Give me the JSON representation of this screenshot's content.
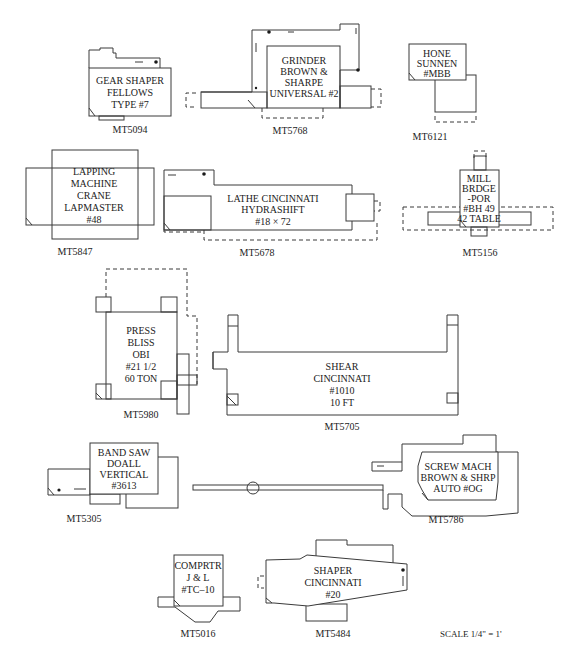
{
  "diagram": {
    "type": "machine-shop-floor-layout",
    "scale_label": "SCALE 1/4\" = 1'",
    "machines": [
      {
        "id": "MT5094",
        "tag": "MT5094",
        "lines": [
          "GEAR SHAPER",
          "FELLOWS",
          "TYPE #7"
        ]
      },
      {
        "id": "MT5768",
        "tag": "MT5768",
        "lines": [
          "GRINDER",
          "BROWN &",
          "SHARPE",
          "UNIVERSAL #2"
        ]
      },
      {
        "id": "MT6121",
        "tag": "MT6121",
        "lines": [
          "HONE",
          "SUNNEN",
          "#MBB"
        ]
      },
      {
        "id": "MT5847",
        "tag": "MT5847",
        "lines": [
          "LAPPING",
          "MACHINE",
          "CRANE",
          "LAPMASTER",
          "#48"
        ]
      },
      {
        "id": "MT5678",
        "tag": "MT5678",
        "lines": [
          "LATHE CINCINNATI",
          "HYDRASHIFT",
          "#18 × 72"
        ]
      },
      {
        "id": "MT5156",
        "tag": "MT5156",
        "lines": [
          "MILL",
          "BRDGE",
          "-POR",
          "#BH 49",
          "42 TABLE"
        ]
      },
      {
        "id": "MT5980",
        "tag": "MT5980",
        "lines": [
          "PRESS",
          "BLISS",
          "OBI",
          "#21 1/2",
          "60 TON"
        ]
      },
      {
        "id": "MT5705",
        "tag": "MT5705",
        "lines": [
          "SHEAR",
          "CINCINNATI",
          "#1010",
          "10 FT"
        ]
      },
      {
        "id": "MT5305",
        "tag": "MT5305",
        "lines": [
          "BAND SAW",
          "DOALL",
          "VERTICAL",
          "#3613"
        ]
      },
      {
        "id": "MT5786",
        "tag": "MT5786",
        "lines": [
          "SCREW MACH",
          "BROWN & SHRP",
          "AUTO #OG"
        ]
      },
      {
        "id": "MT5016",
        "tag": "MT5016",
        "lines": [
          "COMPRTR",
          "J & L",
          "#TC–10"
        ]
      },
      {
        "id": "MT5484",
        "tag": "MT5484",
        "lines": [
          "SHAPER",
          "CINCINNATI",
          "#20"
        ]
      }
    ]
  }
}
